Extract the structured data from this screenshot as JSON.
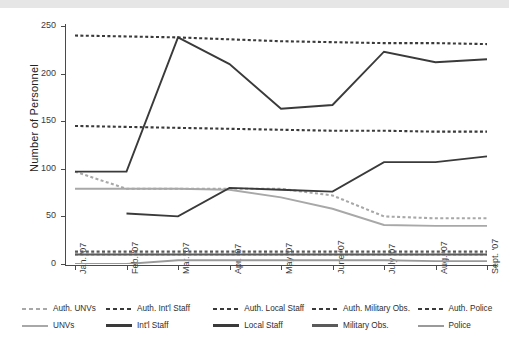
{
  "chart_data": {
    "type": "line",
    "title": "",
    "xlabel": "",
    "ylabel": "Number of Personnel",
    "ylim": [
      0,
      250
    ],
    "yticks": [
      0,
      50,
      100,
      150,
      200,
      250
    ],
    "grid": false,
    "legend_position": "below",
    "categories": [
      "Jan. '07",
      "Feb. '07",
      "Mar. '07",
      "Apr. '07",
      "May '07",
      "June '07",
      "July '07",
      "Aug. '07",
      "Sept. '07"
    ],
    "series": [
      {
        "name": "Auth. UNVs",
        "style": "dashed",
        "color": "#a8a8a8",
        "values": [
          97,
          79,
          79,
          79,
          79,
          72,
          50,
          48,
          48
        ]
      },
      {
        "name": "Auth. Int'l Staff",
        "style": "dashed",
        "color": "#3a3a3a",
        "values": [
          240,
          239,
          238,
          236,
          234,
          233,
          232,
          232,
          231
        ]
      },
      {
        "name": "Auth. Local Staff",
        "style": "dashed",
        "color": "#3a3a3a",
        "values": [
          145,
          144,
          143,
          142,
          141,
          140,
          140,
          139,
          139
        ]
      },
      {
        "name": "Auth. Military Obs.",
        "style": "dashed",
        "color": "#5a5a5a",
        "values": [
          13,
          13,
          13,
          13,
          13,
          13,
          13,
          13,
          13
        ]
      },
      {
        "name": "Auth. Police",
        "style": "dashed",
        "color": "#9a9a9a",
        "values": [
          10,
          10,
          10,
          10,
          10,
          10,
          10,
          10,
          10
        ]
      },
      {
        "name": "UNVs",
        "style": "solid",
        "color": "#a8a8a8",
        "values": [
          79,
          79,
          79,
          78,
          70,
          58,
          41,
          40,
          40
        ]
      },
      {
        "name": "Int'l Staff",
        "style": "solid",
        "color": "#3a3a3a",
        "values": [
          97,
          97,
          238,
          210,
          163,
          167,
          223,
          212,
          215
        ]
      },
      {
        "name": "Local Staff",
        "style": "solid",
        "color": "#3a3a3a",
        "values": [
          null,
          53,
          50,
          80,
          78,
          76,
          107,
          107,
          113
        ]
      },
      {
        "name": "Military Obs.",
        "style": "solid",
        "color": "#5a5a5a",
        "values": [
          10,
          10,
          10,
          10,
          10,
          10,
          10,
          10,
          10
        ]
      },
      {
        "name": "Police",
        "style": "solid",
        "color": "#9a9a9a",
        "values": [
          0,
          0,
          4,
          4,
          4,
          4,
          4,
          3,
          3
        ]
      }
    ]
  },
  "axis": {
    "y_title": "Number of Personnel",
    "y_ticks": [
      "0",
      "50",
      "100",
      "150",
      "200",
      "250"
    ],
    "x_ticks": [
      "Jan. '07",
      "Feb. '07",
      "Mar. '07",
      "Apr. '07",
      "May '07",
      "June '07",
      "July '07",
      "Aug. '07",
      "Sept. '07"
    ]
  },
  "legend": {
    "auth_row": [
      {
        "label": "Auth. UNVs",
        "swatch": "sw-dash-gray"
      },
      {
        "label": "Auth. Int'l  Staff",
        "swatch": "sw-dash-dark"
      },
      {
        "label": "Auth. Local Staff",
        "swatch": "sw-dash-dark"
      },
      {
        "label": "Auth. Military Obs.",
        "swatch": "sw-dash-dark"
      },
      {
        "label": "Auth. Police",
        "swatch": "sw-dash-dark"
      }
    ],
    "actual_row": [
      {
        "label": "UNVs",
        "swatch": "sw-solid-gray"
      },
      {
        "label": "Int'l Staff",
        "swatch": "sw-solid-dark"
      },
      {
        "label": "Local Staff",
        "swatch": "sw-solid-dark"
      },
      {
        "label": "Military Obs.",
        "swatch": "sw-solid-mid"
      },
      {
        "label": "Police",
        "swatch": "sw-solid-gray2"
      }
    ]
  },
  "colors": {
    "axis": "#4a4a4a",
    "dark_series": "#3a3a3a",
    "mid_series": "#5a5a5a",
    "light_series": "#a8a8a8",
    "background": "#ffffff",
    "top_band": "#e6e6e6"
  }
}
